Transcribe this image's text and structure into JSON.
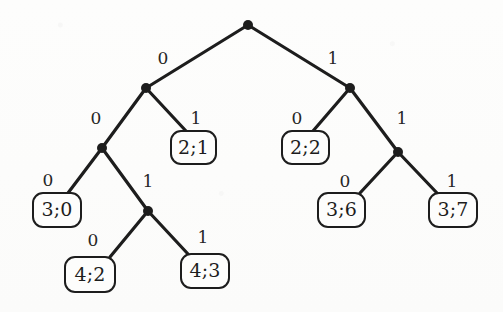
{
  "figure": {
    "kind": "binary-decision-tree",
    "stroke_color": "#1d1d1d",
    "background_color": "#fdfdfc",
    "node_radius": 5
  },
  "internal_nodes": [
    {
      "id": "root",
      "x": 248,
      "y": 25,
      "label": "root-node"
    },
    {
      "id": "n0",
      "x": 146,
      "y": 88,
      "label": "node-0"
    },
    {
      "id": "n1",
      "x": 350,
      "y": 88,
      "label": "node-1"
    },
    {
      "id": "n00",
      "x": 102,
      "y": 148,
      "label": "node-00"
    },
    {
      "id": "n11",
      "x": 398,
      "y": 152,
      "label": "node-11"
    },
    {
      "id": "n001",
      "x": 148,
      "y": 211,
      "label": "node-001"
    }
  ],
  "leaves": [
    {
      "id": "l01",
      "text": "2;1",
      "x": 170,
      "y": 130,
      "w": 47,
      "h": 35
    },
    {
      "id": "l10",
      "text": "2;2",
      "x": 281,
      "y": 130,
      "w": 49,
      "h": 35
    },
    {
      "id": "l000",
      "text": "3;0",
      "x": 32,
      "y": 192,
      "w": 50,
      "h": 36
    },
    {
      "id": "l110",
      "text": "3;6",
      "x": 317,
      "y": 192,
      "w": 49,
      "h": 36
    },
    {
      "id": "l111",
      "text": "3;7",
      "x": 428,
      "y": 192,
      "w": 50,
      "h": 36
    },
    {
      "id": "l0010",
      "text": "4;2",
      "x": 64,
      "y": 256,
      "w": 52,
      "h": 37
    },
    {
      "id": "l0011",
      "text": "4;3",
      "x": 180,
      "y": 253,
      "w": 50,
      "h": 36
    }
  ],
  "edges": [
    {
      "from": "root",
      "to": "n0",
      "bit": "0",
      "lx": 163,
      "ly": 58,
      "x1": 248,
      "y1": 25,
      "x2": 146,
      "y2": 88
    },
    {
      "from": "root",
      "to": "n1",
      "bit": "1",
      "lx": 333,
      "ly": 58,
      "x1": 248,
      "y1": 25,
      "x2": 350,
      "y2": 88
    },
    {
      "from": "n0",
      "to": "n00",
      "bit": "0",
      "lx": 96,
      "ly": 118,
      "x1": 146,
      "y1": 88,
      "x2": 102,
      "y2": 148
    },
    {
      "from": "n0",
      "to": "l01",
      "bit": "1",
      "lx": 196,
      "ly": 118,
      "x1": 146,
      "y1": 88,
      "x2": 186,
      "y2": 131
    },
    {
      "from": "n1",
      "to": "l10",
      "bit": "0",
      "lx": 297,
      "ly": 118,
      "x1": 350,
      "y1": 88,
      "x2": 313,
      "y2": 131
    },
    {
      "from": "n1",
      "to": "n11",
      "bit": "1",
      "lx": 402,
      "ly": 118,
      "x1": 350,
      "y1": 88,
      "x2": 398,
      "y2": 152
    },
    {
      "from": "n00",
      "to": "l000",
      "bit": "0",
      "lx": 48,
      "ly": 180,
      "x1": 102,
      "y1": 148,
      "x2": 68,
      "y2": 193
    },
    {
      "from": "n00",
      "to": "n001",
      "bit": "1",
      "lx": 148,
      "ly": 181,
      "x1": 102,
      "y1": 148,
      "x2": 148,
      "y2": 211
    },
    {
      "from": "n11",
      "to": "l110",
      "bit": "0",
      "lx": 345,
      "ly": 181,
      "x1": 398,
      "y1": 152,
      "x2": 360,
      "y2": 193
    },
    {
      "from": "n11",
      "to": "l111",
      "bit": "1",
      "lx": 452,
      "ly": 181,
      "x1": 398,
      "y1": 152,
      "x2": 437,
      "y2": 193
    },
    {
      "from": "n001",
      "to": "l0010",
      "bit": "0",
      "lx": 93,
      "ly": 240,
      "x1": 148,
      "y1": 211,
      "x2": 110,
      "y2": 257
    },
    {
      "from": "n001",
      "to": "l0011",
      "bit": "1",
      "lx": 203,
      "ly": 237,
      "x1": 148,
      "y1": 211,
      "x2": 188,
      "y2": 254
    }
  ]
}
